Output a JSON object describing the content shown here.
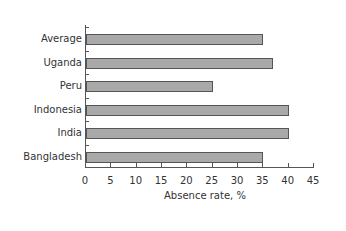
{
  "chart_data": {
    "type": "bar",
    "orientation": "horizontal",
    "title": "",
    "xlabel": "Absence rate, %",
    "ylabel": "",
    "categories": [
      "Average",
      "Uganda",
      "Peru",
      "Indonesia",
      "India",
      "Bangladesh"
    ],
    "values": [
      35,
      37,
      25,
      40,
      40,
      35
    ],
    "xlim": [
      0,
      45
    ],
    "x_ticks": [
      "0",
      "5",
      "10",
      "15",
      "20",
      "25",
      "30",
      "35",
      "40",
      "45"
    ],
    "grid": false,
    "legend": null,
    "colors": {
      "bar_fill": "#a9a9a9",
      "bar_edge": "#555555",
      "axis": "#555555"
    }
  }
}
